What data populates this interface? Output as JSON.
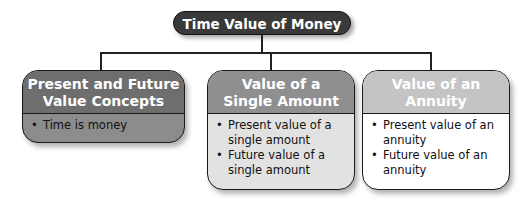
{
  "diagram": {
    "title": "Time Value of Money",
    "nodes": [
      {
        "heading_line1": "Present and Future",
        "heading_line2": "Value Concepts",
        "bullets": [
          "Time is money"
        ]
      },
      {
        "heading_line1": "Value of a",
        "heading_line2": "Single Amount",
        "bullets": [
          "Present value of a single amount",
          "Future value of a single amount"
        ]
      },
      {
        "heading_line1": "Value of an",
        "heading_line2": "Annuity",
        "bullets": [
          "Present value of an annuity",
          "Future value of an annuity"
        ]
      }
    ],
    "bullet_glyph": "•",
    "colors": {
      "title_bg": "#3a3a3a",
      "node1_header": "#6e6e6e",
      "node1_body": "#8c8c8c",
      "node2_header": "#8f8f8f",
      "node2_body": "#e2e2e2",
      "node3_header": "#c4c4c4",
      "node3_body": "#ffffff"
    }
  }
}
